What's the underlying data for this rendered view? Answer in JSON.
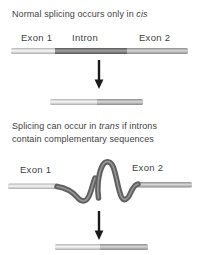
{
  "background": "#ffffff",
  "text_color": "#3f3f3f",
  "panel_cis": {
    "caption_pre": "Normal splicing occurs only in ",
    "caption_italic": "cis",
    "labels": {
      "exon1": "Exon 1",
      "intron": "Intron",
      "exon2": "Exon 2"
    }
  },
  "panel_trans": {
    "caption_line1_pre": "Splicing can occur in ",
    "caption_line1_italic": "trans",
    "caption_line1_post": " if introns",
    "caption_line2": "contain complementary sequences",
    "labels": {
      "exon1": "Exon 1",
      "exon2": "Exon 2"
    }
  },
  "colors": {
    "exon1_segment": "#d9d9d9",
    "intron_segment": "#6e6e6e",
    "exon2_segment": "#b3b3b3",
    "arrow": "#1a1a1a",
    "background": "#ffffff",
    "text": "#3f3f3f"
  }
}
